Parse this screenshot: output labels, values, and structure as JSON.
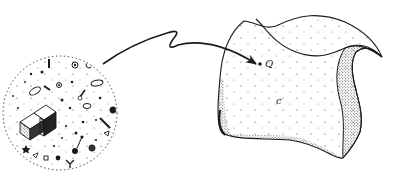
{
  "figure": {
    "type": "illustration",
    "colors": {
      "ink": "#1a1a1a",
      "background": "#ffffff"
    }
  },
  "particle_region": {
    "shape": "dashed-circle",
    "center": [
      60,
      113
    ],
    "radius": 57
  },
  "arrow": {
    "from": [
      103,
      64
    ],
    "to": [
      256,
      64
    ]
  },
  "phase_space": {
    "point_label": "Q",
    "point": [
      260,
      64
    ],
    "region_label": "c"
  }
}
